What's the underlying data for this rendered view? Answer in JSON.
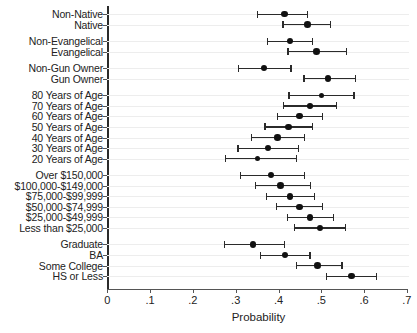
{
  "chart_data": {
    "type": "scatter",
    "title": "",
    "xlabel": "Probability",
    "ylabel": "",
    "xlim": [
      0,
      0.7
    ],
    "xticks": [
      0,
      0.1,
      0.2,
      0.3,
      0.4,
      0.5,
      0.6,
      0.7
    ],
    "xticklabels": [
      "0",
      ".1",
      ".2",
      ".3",
      ".4",
      ".5",
      ".6",
      ".7"
    ],
    "grid": true,
    "reference_line": 0.5,
    "legend": "none",
    "annotations": [],
    "groups": [
      {
        "name": "Nativity",
        "categories": [
          "Non-Native",
          "Native"
        ],
        "values": [
          0.414,
          0.468
        ],
        "ci_low": [
          0.349,
          0.409
        ],
        "ci_high": [
          0.466,
          0.52
        ]
      },
      {
        "name": "Evangelical",
        "categories": [
          "Non-Evangelical",
          "Evangelical"
        ],
        "values": [
          0.427,
          0.489
        ],
        "ci_low": [
          0.372,
          0.421
        ],
        "ci_high": [
          0.479,
          0.557
        ]
      },
      {
        "name": "Gun Ownership",
        "categories": [
          "Non-Gun Owner",
          "Gun Owner"
        ],
        "values": [
          0.366,
          0.516
        ],
        "ci_low": [
          0.306,
          0.458
        ],
        "ci_high": [
          0.428,
          0.578
        ]
      },
      {
        "name": "Age",
        "categories": [
          "80 Years of Age",
          "70 Years of Age",
          "60 Years of Age",
          "50 Years of Age",
          "40 Years of Age",
          "30 Years of Age",
          "20 Years of Age"
        ],
        "values": [
          0.501,
          0.474,
          0.449,
          0.423,
          0.398,
          0.375,
          0.351
        ],
        "ci_low": [
          0.423,
          0.411,
          0.396,
          0.367,
          0.336,
          0.304,
          0.275
        ],
        "ci_high": [
          0.575,
          0.534,
          0.502,
          0.479,
          0.46,
          0.445,
          0.441
        ],
        "marker_sizes": [
          5.0,
          5.6,
          6.2,
          6.6,
          6.4,
          6.0,
          5.4
        ]
      },
      {
        "name": "Income",
        "categories": [
          "Over $150,000",
          "$100,000-$149,000",
          "$75,000-$99,999",
          "$50,000-$74,999",
          "$25,000-$49,999",
          "Less than $25,000"
        ],
        "values": [
          0.382,
          0.405,
          0.427,
          0.449,
          0.474,
          0.497
        ],
        "ci_low": [
          0.31,
          0.345,
          0.37,
          0.394,
          0.419,
          0.436
        ],
        "ci_high": [
          0.46,
          0.474,
          0.483,
          0.502,
          0.527,
          0.555
        ]
      },
      {
        "name": "Education",
        "categories": [
          "Graduate",
          "BA",
          "Some College",
          "HS or Less"
        ],
        "values": [
          0.34,
          0.415,
          0.491,
          0.571
        ],
        "ci_low": [
          0.273,
          0.357,
          0.441,
          0.511
        ],
        "ci_high": [
          0.413,
          0.472,
          0.547,
          0.627
        ]
      }
    ]
  }
}
